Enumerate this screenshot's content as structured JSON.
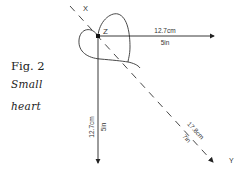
{
  "caption": {
    "figure": "Fig. 2",
    "line1": "Small",
    "line2": "heart"
  },
  "diagram": {
    "point_label": "Z",
    "axis_x_label": "X",
    "axis_y_label": "Y",
    "horizontal": {
      "cm": "12.7cm",
      "in": "5in"
    },
    "vertical": {
      "cm": "12.7cm",
      "in": "5in"
    },
    "diagonal": {
      "cm": "17.8cm",
      "in": "7in"
    },
    "line_color": "#222222"
  }
}
